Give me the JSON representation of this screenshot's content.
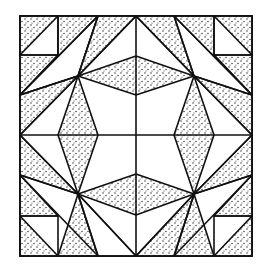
{
  "figure": {
    "colors": {
      "line": "#111111",
      "background": "#ffffff",
      "stipple": "#222222"
    }
  }
}
